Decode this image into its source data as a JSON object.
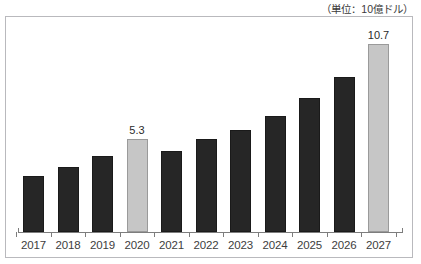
{
  "chart_title": "",
  "unit_label": "（単位：10億ドル）",
  "chart_data": {
    "type": "bar",
    "title": "",
    "subtitle": "（単位：10億ドル）",
    "xlabel": "",
    "ylabel": "10億ドル",
    "ylim": [
      0,
      11.5
    ],
    "grid": false,
    "legend": "none",
    "axis": {
      "show_y_axis": false,
      "show_x_axis": true,
      "x_tick_style": "between-categories"
    },
    "categories": [
      "2017",
      "2018",
      "2019",
      "2020",
      "2021",
      "2022",
      "2023",
      "2024",
      "2025",
      "2026",
      "2027"
    ],
    "values": [
      3.2,
      3.7,
      4.3,
      5.3,
      4.6,
      5.3,
      5.8,
      6.6,
      7.6,
      8.8,
      10.7
    ],
    "labeled_points": [
      {
        "category": "2020",
        "value": 5.3,
        "label": "5.3"
      },
      {
        "category": "2027",
        "value": 10.7,
        "label": "10.7"
      }
    ],
    "colors": {
      "bar_dark": "#262626",
      "bar_highlight": "#c6c6c6",
      "axis": "#7d7d7d",
      "frame": "#b9b9bd",
      "text": "#3d3d3d",
      "background": "#ffffff"
    },
    "bars": [
      {
        "category": "2017",
        "value": 3.2,
        "style": "dark",
        "label": ""
      },
      {
        "category": "2018",
        "value": 3.7,
        "style": "dark",
        "label": ""
      },
      {
        "category": "2019",
        "value": 4.3,
        "style": "dark",
        "label": ""
      },
      {
        "category": "2020",
        "value": 5.3,
        "style": "highlight",
        "label": "5.3"
      },
      {
        "category": "2021",
        "value": 4.6,
        "style": "dark",
        "label": ""
      },
      {
        "category": "2022",
        "value": 5.3,
        "style": "dark",
        "label": ""
      },
      {
        "category": "2023",
        "value": 5.8,
        "style": "dark",
        "label": ""
      },
      {
        "category": "2024",
        "value": 6.6,
        "style": "dark",
        "label": ""
      },
      {
        "category": "2025",
        "value": 7.6,
        "style": "dark",
        "label": ""
      },
      {
        "category": "2026",
        "value": 8.8,
        "style": "dark",
        "label": ""
      },
      {
        "category": "2027",
        "value": 10.7,
        "style": "highlight",
        "label": "10.7"
      }
    ]
  }
}
